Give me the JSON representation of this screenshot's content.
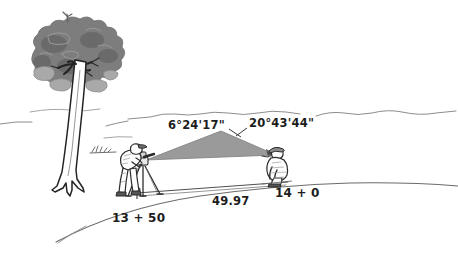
{
  "figure": {
    "background_color": "#ffffff",
    "ink_color": "#2b2b2b",
    "sight_wedge_color": "#9a9a9a",
    "sight_wedge_dark_color": "#4a4a4a",
    "foliage_color": "#7d7d7d",
    "foliage_dark_color": "#5e5e5e",
    "foliage_light_color": "#a8a8a8"
  },
  "labels": {
    "angle_left": "6°24'17\"",
    "angle_right": "20°43'44\"",
    "station_left": "13 + 50",
    "station_right": "14 + 0",
    "distance": "49.97"
  },
  "elements": {
    "tree": "tree",
    "instrument_operator": "surveyor-with-theodolite",
    "rodman": "crouching-rodman",
    "sight_wedge": "sight-line-wedge",
    "ground_line": "ground-profile-line",
    "tape_line": "measuring-tape-line",
    "hills": "distant-hill-outlines",
    "grass_tuft": "grass-tuft"
  }
}
